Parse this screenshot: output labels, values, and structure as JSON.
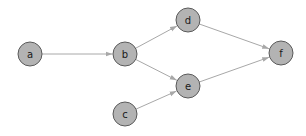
{
  "diagram": {
    "type": "directed-graph",
    "colors": {
      "node_fill": "#b3b3b3",
      "node_stroke": "#5a5a5a",
      "edge": "#a8a8a8",
      "background": "#ffffff"
    },
    "nodes": [
      {
        "id": "a",
        "label": "a",
        "x": 30,
        "y": 54,
        "r": 12
      },
      {
        "id": "b",
        "label": "b",
        "x": 125,
        "y": 54,
        "r": 12
      },
      {
        "id": "c",
        "label": "c",
        "x": 125,
        "y": 114,
        "r": 12
      },
      {
        "id": "d",
        "label": "d",
        "x": 188,
        "y": 20,
        "r": 12
      },
      {
        "id": "e",
        "label": "e",
        "x": 188,
        "y": 86,
        "r": 12
      },
      {
        "id": "f",
        "label": "f",
        "x": 281,
        "y": 53,
        "r": 12
      }
    ],
    "edges": [
      {
        "from": "a",
        "to": "b"
      },
      {
        "from": "b",
        "to": "d"
      },
      {
        "from": "b",
        "to": "e"
      },
      {
        "from": "c",
        "to": "e"
      },
      {
        "from": "d",
        "to": "f"
      },
      {
        "from": "e",
        "to": "f"
      }
    ]
  }
}
